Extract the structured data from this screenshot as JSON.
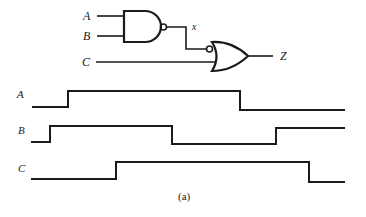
{
  "circuit": {
    "inputs": [
      "A",
      "B",
      "C"
    ],
    "intermediate": "x",
    "output": "Z",
    "gates": [
      {
        "type": "NAND",
        "inputs": [
          "A",
          "B"
        ],
        "output": "x"
      },
      {
        "type": "OR",
        "inputs": [
          "x (inverted)",
          "C"
        ],
        "output": "Z"
      }
    ]
  },
  "labels": {
    "in_a": "A",
    "in_b": "B",
    "in_c": "C",
    "node_x": "x",
    "out_z": "Z",
    "wave_a": "A",
    "wave_b": "B",
    "wave_c": "C",
    "caption": "(a)"
  },
  "waveforms": [
    {
      "name": "A",
      "levels": [
        0,
        1,
        0
      ],
      "transitions_px": [
        68,
        240
      ]
    },
    {
      "name": "B",
      "levels": [
        0,
        1,
        0,
        1
      ],
      "transitions_px": [
        50,
        172,
        276
      ]
    },
    {
      "name": "C",
      "levels": [
        0,
        1,
        0
      ],
      "transitions_px": [
        116,
        309
      ]
    }
  ],
  "colors": {
    "ink": "#1a1a1a",
    "background": "#ffffff"
  }
}
